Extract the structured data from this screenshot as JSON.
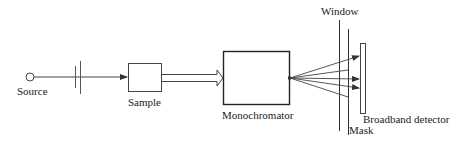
{
  "diagram": {
    "type": "optical-setup-schematic",
    "stroke_color": "#333333",
    "components": {
      "source": {
        "label": "Source"
      },
      "sample": {
        "label": "Sample"
      },
      "monochromator": {
        "label": "Monochromator"
      },
      "window": {
        "label": "Window"
      },
      "mask": {
        "label": "Mask"
      },
      "detector": {
        "label": "Broadband detector"
      }
    },
    "connections": [
      {
        "from": "source",
        "to": "sample",
        "style": "line-arrow",
        "via": "chopper/lens"
      },
      {
        "from": "sample",
        "to": "monochromator",
        "style": "hollow-block-arrow"
      },
      {
        "from": "monochromator",
        "to": "detector",
        "style": "fan-of-rays",
        "rays": 5,
        "rays_passing_mask": 3
      }
    ]
  }
}
